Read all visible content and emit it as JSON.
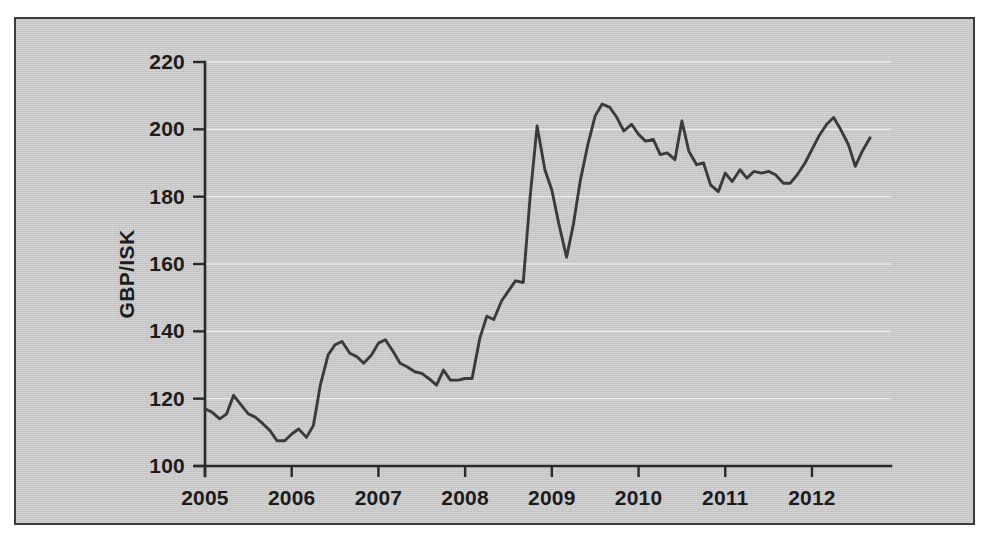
{
  "figure": {
    "background_color": "#ffffff",
    "panel_color": "#c8c8c8",
    "border_color": "#3a3a3a",
    "line_color": "#3b3b3b",
    "grid_color": "#f2f2f2"
  },
  "chart_data": {
    "type": "line",
    "title": "",
    "subtitle": "",
    "xlabel": "",
    "ylabel": "GBP/ISK",
    "xlim": [
      2005.0,
      2012.75
    ],
    "ylim": [
      100,
      220
    ],
    "ytick_labels": [
      "100",
      "120",
      "140",
      "160",
      "180",
      "200",
      "220"
    ],
    "yticks": [
      100,
      120,
      140,
      160,
      180,
      200,
      220
    ],
    "xtick_labels": [
      "2005",
      "2006",
      "2007",
      "2008",
      "2009",
      "2010",
      "2011",
      "2012"
    ],
    "xticks": [
      2005,
      2006,
      2007,
      2008,
      2009,
      2010,
      2011,
      2012
    ],
    "grid": true,
    "grid_axis": "y",
    "legend": false,
    "legend_position": "none",
    "series": [
      {
        "name": "GBP/ISK",
        "color": "#3b3b3b",
        "x": [
          2005.0,
          2005.08,
          2005.17,
          2005.25,
          2005.33,
          2005.42,
          2005.5,
          2005.58,
          2005.67,
          2005.75,
          2005.83,
          2005.92,
          2006.0,
          2006.08,
          2006.17,
          2006.25,
          2006.33,
          2006.42,
          2006.5,
          2006.58,
          2006.67,
          2006.75,
          2006.83,
          2006.92,
          2007.0,
          2007.08,
          2007.17,
          2007.25,
          2007.33,
          2007.42,
          2007.5,
          2007.58,
          2007.67,
          2007.75,
          2007.83,
          2007.92,
          2008.0,
          2008.08,
          2008.17,
          2008.25,
          2008.33,
          2008.42,
          2008.5,
          2008.58,
          2008.67,
          2008.75,
          2008.83,
          2008.92,
          2009.0,
          2009.08,
          2009.17,
          2009.25,
          2009.33,
          2009.42,
          2009.5,
          2009.58,
          2009.67,
          2009.75,
          2009.83,
          2009.92,
          2010.0,
          2010.08,
          2010.17,
          2010.25,
          2010.33,
          2010.42,
          2010.5,
          2010.58,
          2010.67,
          2010.75,
          2010.83,
          2010.92,
          2011.0,
          2011.08,
          2011.17,
          2011.25,
          2011.33,
          2011.42,
          2011.5,
          2011.58,
          2011.67,
          2011.75,
          2011.83,
          2011.92,
          2012.0,
          2012.08,
          2012.17,
          2012.25,
          2012.33,
          2012.42,
          2012.5,
          2012.58,
          2012.67
        ],
        "y": [
          117.0,
          116.0,
          114.0,
          115.5,
          121.0,
          118.0,
          115.5,
          114.5,
          112.5,
          110.5,
          107.5,
          107.5,
          109.5,
          111.0,
          108.5,
          112.0,
          124.0,
          133.0,
          136.0,
          137.0,
          133.5,
          132.5,
          130.5,
          133.0,
          136.5,
          137.5,
          134.0,
          130.5,
          129.5,
          128.0,
          127.5,
          126.0,
          124.0,
          128.5,
          125.5,
          125.5,
          126.0,
          126.0,
          138.0,
          144.5,
          143.5,
          149.0,
          152.0,
          155.0,
          154.5,
          180.0,
          201.0,
          188.0,
          182.0,
          172.0,
          162.0,
          172.0,
          185.0,
          196.0,
          204.0,
          207.5,
          206.5,
          203.5,
          199.5,
          201.5,
          198.5,
          196.5,
          197.0,
          192.5,
          193.0,
          191.0,
          202.5,
          193.5,
          189.5,
          190.0,
          183.5,
          181.5,
          187.0,
          184.5,
          188.0,
          185.5,
          187.5,
          187.0,
          187.5,
          186.5,
          184.0,
          184.0,
          186.5,
          190.0,
          194.0,
          198.0,
          201.5,
          203.5,
          200.0,
          195.5,
          189.0,
          193.5,
          197.5
        ]
      }
    ]
  }
}
